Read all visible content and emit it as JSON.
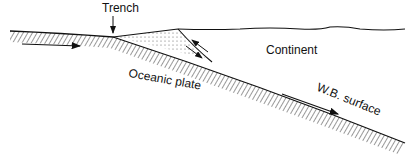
{
  "diagram": {
    "type": "subduction-zone-cross-section",
    "labels": {
      "trench": "Trench",
      "continent": "Continent",
      "oceanic_plate": "Oceanic plate",
      "wb_surface": "W.B. surface"
    },
    "colors": {
      "line": "#111111",
      "hatch": "#333333",
      "background": "#ffffff"
    }
  }
}
